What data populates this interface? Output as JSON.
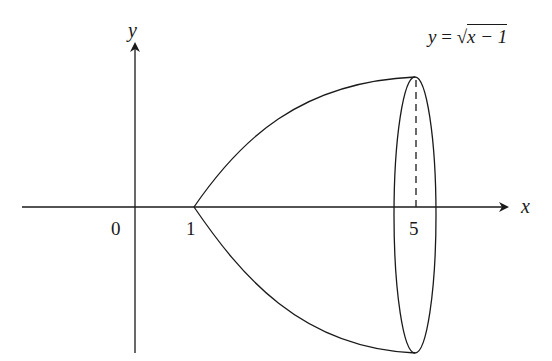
{
  "diagram": {
    "equation": {
      "lhs": "y",
      "eq": " = ",
      "radicand": "x − 1"
    },
    "axes": {
      "x_label": "x",
      "y_label": "y"
    },
    "ticks": [
      {
        "label": "0",
        "value": 0
      },
      {
        "label": "1",
        "value": 1
      },
      {
        "label": "5",
        "value": 5
      }
    ],
    "colors": {
      "stroke": "#1a1a1a",
      "background": "#ffffff"
    }
  }
}
